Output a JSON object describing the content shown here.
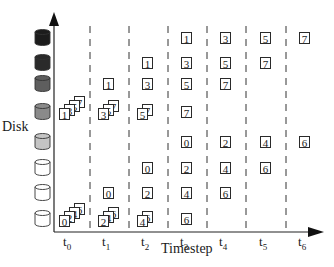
{
  "diagram": {
    "y_axis_label": "Disk",
    "x_axis_label": "Timestep",
    "timesteps": [
      {
        "label": "t",
        "sub": "0"
      },
      {
        "label": "t",
        "sub": "1"
      },
      {
        "label": "t",
        "sub": "2"
      },
      {
        "label": "t",
        "sub": "3"
      },
      {
        "label": "t",
        "sub": "4"
      },
      {
        "label": "t",
        "sub": "5"
      },
      {
        "label": "t",
        "sub": "6"
      }
    ],
    "disks": [
      {
        "row": 0,
        "fill": "#1c1c1c"
      },
      {
        "row": 1,
        "fill": "#2a2a2a"
      },
      {
        "row": 2,
        "fill": "#5e5e5e"
      },
      {
        "row": 3,
        "fill": "#8a8a8a"
      },
      {
        "row": 4,
        "fill": "#c4c4c4"
      },
      {
        "row": 5,
        "fill": "#ffffff"
      },
      {
        "row": 6,
        "fill": "#ffffff"
      },
      {
        "row": 7,
        "fill": "#ffffff"
      }
    ],
    "placements": [
      {
        "timestep": 0,
        "row": 3,
        "stack": [
          "1",
          "3",
          "5",
          "7"
        ]
      },
      {
        "timestep": 0,
        "row": 7,
        "stack": [
          "0",
          "2",
          "4",
          "6"
        ]
      },
      {
        "timestep": 1,
        "row": 2,
        "stack": [
          "1"
        ]
      },
      {
        "timestep": 1,
        "row": 3,
        "stack": [
          "3",
          "5",
          "7"
        ]
      },
      {
        "timestep": 1,
        "row": 6,
        "stack": [
          "0"
        ]
      },
      {
        "timestep": 1,
        "row": 7,
        "stack": [
          "2",
          "4",
          "6"
        ]
      },
      {
        "timestep": 2,
        "row": 1,
        "stack": [
          "1"
        ]
      },
      {
        "timestep": 2,
        "row": 2,
        "stack": [
          "3"
        ]
      },
      {
        "timestep": 2,
        "row": 3,
        "stack": [
          "5",
          "7"
        ]
      },
      {
        "timestep": 2,
        "row": 5,
        "stack": [
          "0"
        ]
      },
      {
        "timestep": 2,
        "row": 6,
        "stack": [
          "2"
        ]
      },
      {
        "timestep": 2,
        "row": 7,
        "stack": [
          "4",
          "6"
        ]
      },
      {
        "timestep": 3,
        "row": 0,
        "stack": [
          "1"
        ]
      },
      {
        "timestep": 3,
        "row": 1,
        "stack": [
          "3"
        ]
      },
      {
        "timestep": 3,
        "row": 2,
        "stack": [
          "5"
        ]
      },
      {
        "timestep": 3,
        "row": 3,
        "stack": [
          "7"
        ]
      },
      {
        "timestep": 3,
        "row": 4,
        "stack": [
          "0"
        ]
      },
      {
        "timestep": 3,
        "row": 5,
        "stack": [
          "2"
        ]
      },
      {
        "timestep": 3,
        "row": 6,
        "stack": [
          "4"
        ]
      },
      {
        "timestep": 3,
        "row": 7,
        "stack": [
          "6"
        ]
      },
      {
        "timestep": 4,
        "row": 0,
        "stack": [
          "3"
        ]
      },
      {
        "timestep": 4,
        "row": 1,
        "stack": [
          "5"
        ]
      },
      {
        "timestep": 4,
        "row": 2,
        "stack": [
          "7"
        ]
      },
      {
        "timestep": 4,
        "row": 4,
        "stack": [
          "2"
        ]
      },
      {
        "timestep": 4,
        "row": 5,
        "stack": [
          "4"
        ]
      },
      {
        "timestep": 4,
        "row": 6,
        "stack": [
          "6"
        ]
      },
      {
        "timestep": 5,
        "row": 0,
        "stack": [
          "5"
        ]
      },
      {
        "timestep": 5,
        "row": 1,
        "stack": [
          "7"
        ]
      },
      {
        "timestep": 5,
        "row": 4,
        "stack": [
          "4"
        ]
      },
      {
        "timestep": 5,
        "row": 5,
        "stack": [
          "6"
        ]
      },
      {
        "timestep": 6,
        "row": 0,
        "stack": [
          "7"
        ]
      },
      {
        "timestep": 6,
        "row": 4,
        "stack": [
          "6"
        ]
      }
    ]
  }
}
